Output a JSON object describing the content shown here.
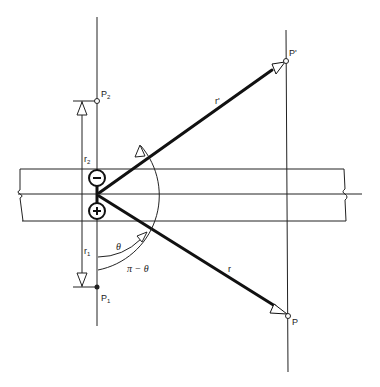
{
  "diagram": {
    "charges": [
      {
        "sign": "−",
        "symbol": "minus",
        "cx": 97,
        "cy": 178
      },
      {
        "sign": "+",
        "symbol": "plus",
        "cx": 97,
        "cy": 211
      }
    ],
    "points": {
      "P2": {
        "label": "P",
        "sub": "2",
        "x": 97,
        "y": 101
      },
      "P1": {
        "label": "P",
        "sub": "1",
        "x": 97,
        "y": 287
      },
      "Pprime": {
        "label": "P'",
        "x": 286,
        "y": 61
      },
      "P": {
        "label": "P",
        "x": 288,
        "y": 316
      }
    },
    "vectors": {
      "r_prime": {
        "label": "r'"
      },
      "r": {
        "label": "r"
      }
    },
    "dimensions": {
      "r2": {
        "label": "r",
        "sub": "2"
      },
      "r1": {
        "label": "r",
        "sub": "1"
      }
    },
    "angles": {
      "theta": {
        "label": "θ"
      },
      "pi_minus_theta": {
        "label": "π − θ"
      }
    },
    "colors": {
      "line": "#222222",
      "background": "#ffffff"
    }
  }
}
